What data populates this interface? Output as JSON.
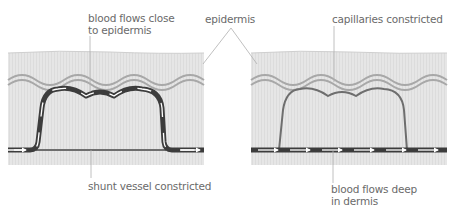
{
  "labels": {
    "blood_close_line1": "blood flows close",
    "blood_close_line2": "to epidermis",
    "epidermis": "epidermis",
    "capillaries": "capillaries constricted",
    "shunt": "shunt vessel constricted",
    "blood_deep_line1": "blood flows deep",
    "blood_deep_line2": "in dermis"
  },
  "panels": [
    {
      "name": "vasodilation",
      "description": "Warm: blood flows through capillaries near epidermis; shunt vessel constricted"
    },
    {
      "name": "vasoconstriction",
      "description": "Cold: capillaries constricted; blood flows through shunt vessel deep in dermis"
    }
  ],
  "colors": {
    "dermis": "#e4e4e4",
    "epidermis_band": "#dadada",
    "skin_line": "#a8a8a8",
    "vessel_dark": "#3c3c3c",
    "vessel_constricted": "#6e6e6e",
    "arrow": "#ffffff",
    "leader_line": "#b0b0b0",
    "text": "#6a6a6a"
  }
}
